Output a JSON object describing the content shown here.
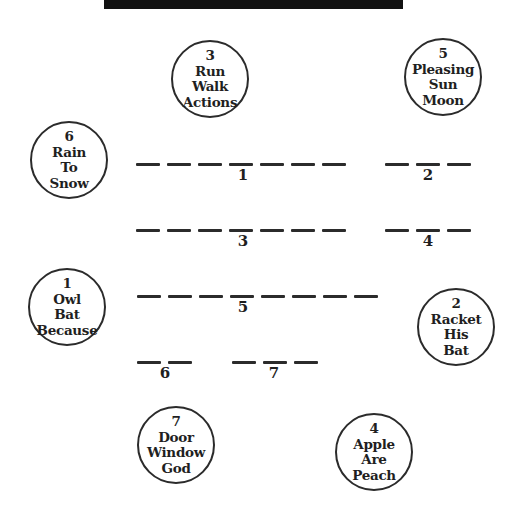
{
  "colors": {
    "paper": "#ffffff",
    "ink": "#222222",
    "redaction_bar": "#121212"
  },
  "clue_circles": [
    {
      "number": "3",
      "words": [
        "Run",
        "Walk",
        "Actions"
      ]
    },
    {
      "number": "5",
      "words": [
        "Pleasing",
        "Sun",
        "Moon"
      ]
    },
    {
      "number": "6",
      "words": [
        "Rain",
        "To",
        "Snow"
      ]
    },
    {
      "number": "1",
      "words": [
        "Owl",
        "Bat",
        "Because"
      ]
    },
    {
      "number": "2",
      "words": [
        "Racket",
        "His",
        "Bat"
      ]
    },
    {
      "number": "7",
      "words": [
        "Door",
        "Window",
        "God"
      ]
    },
    {
      "number": "4",
      "words": [
        "Apple",
        "Are",
        "Peach"
      ]
    }
  ],
  "answer_blanks": [
    {
      "number": "1",
      "dash_count": 7
    },
    {
      "number": "2",
      "dash_count": 3
    },
    {
      "number": "3",
      "dash_count": 7
    },
    {
      "number": "4",
      "dash_count": 3
    },
    {
      "number": "5",
      "dash_count": 8
    },
    {
      "number": "6",
      "dash_count": 2
    },
    {
      "number": "7",
      "dash_count": 3
    }
  ]
}
